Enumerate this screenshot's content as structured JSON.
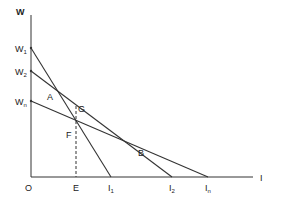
{
  "axes": {
    "y_label": "W",
    "x_label": "I",
    "origin_label": "O"
  },
  "y_ticks": [
    {
      "label": "W",
      "sub": "1",
      "y": 48
    },
    {
      "label": "W",
      "sub": "2",
      "y": 71
    },
    {
      "label": "W",
      "sub": "n",
      "y": 101
    }
  ],
  "x_ticks": [
    {
      "label": "E",
      "sub": "",
      "x": 76
    },
    {
      "label": "I",
      "sub": "1",
      "x": 111
    },
    {
      "label": "I",
      "sub": "2",
      "x": 172
    },
    {
      "label": "I",
      "sub": "n",
      "x": 208
    }
  ],
  "lines": [
    {
      "name": "W1-I1",
      "from": "W1",
      "to": "I1"
    },
    {
      "name": "W2-I2",
      "from": "W2",
      "to": "I2"
    },
    {
      "name": "Wn-In",
      "from": "Wn",
      "to": "In"
    }
  ],
  "points": {
    "A": "A",
    "B": "B",
    "F": "F",
    "G": "G"
  },
  "colors": {
    "line": "#333333",
    "background": "#ffffff"
  }
}
